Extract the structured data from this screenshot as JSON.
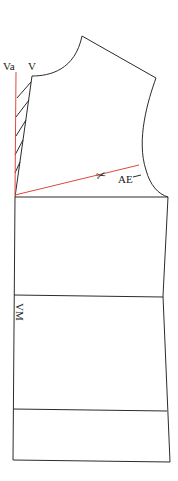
{
  "diagram": {
    "type": "sewing-pattern-bodice-front",
    "labels": {
      "va": "Va",
      "v": "V",
      "ae": "AE",
      "vm": "VM"
    },
    "symbols": {
      "scissors": "✂"
    },
    "colors": {
      "outline": "#2b2b2b",
      "construction_line": "#e0483c",
      "background": "#ffffff"
    }
  }
}
